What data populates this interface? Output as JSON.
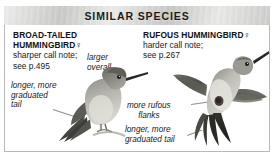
{
  "header": {
    "title": "SIMILAR SPECIES"
  },
  "columns": {
    "left": {
      "species_name_line1": "BROAD-TAILED",
      "species_name_line2": "HUMMINGBIRD",
      "sex_symbol": "♀",
      "note_line1": "sharper call note;",
      "note_line2": "see p.495"
    },
    "right": {
      "species_name": "RUFOUS HUMMINGBIRD",
      "sex_symbol": "♀",
      "note_line1": "harder call note;",
      "note_line2": "see p.267"
    }
  },
  "annotations": {
    "larger_overall": "larger\noverall",
    "left_tail": "longer, more\ngraduated\ntail",
    "rufous_flanks": "more rufous\nflanks",
    "mid_tail": "longer, more\ngraduated tail"
  },
  "illustrations": {
    "left_bird": "perched-hummingbird-female",
    "right_bird": "flying-hummingbird-female"
  },
  "colors": {
    "header_band": "#d5d5d3",
    "border": "#b9b9b7",
    "text": "#1a1a1a",
    "leader_line": "#8e8e8c",
    "bird_dark": "#3a3a38",
    "bird_mid": "#8d8d86",
    "bird_light": "#d9d9d2"
  }
}
